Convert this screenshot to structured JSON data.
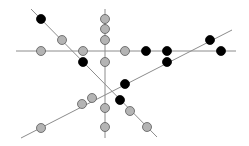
{
  "diagram": {
    "width": 249,
    "height": 146,
    "colors": {
      "background": "#ffffff",
      "line": "#8c8c8c",
      "gray_fill": "#b4b4b4",
      "gray_stroke": "#5a5a5a",
      "black_fill": "#000000"
    },
    "node_radius": 4.5,
    "lines": [
      {
        "id": "horizontal",
        "x1": 16,
        "y1": 51,
        "x2": 236,
        "y2": 51
      },
      {
        "id": "vertical",
        "x1": 105,
        "y1": 9,
        "x2": 105,
        "y2": 138
      },
      {
        "id": "descending-diagonal",
        "x1": 31,
        "y1": 9,
        "x2": 157,
        "y2": 137
      },
      {
        "id": "ascending-diagonal",
        "x1": 21,
        "y1": 138,
        "x2": 232,
        "y2": 30
      }
    ],
    "nodes": [
      {
        "x": 41,
        "y": 19,
        "color": "black"
      },
      {
        "x": 62,
        "y": 40,
        "color": "gray"
      },
      {
        "x": 41,
        "y": 51,
        "color": "gray"
      },
      {
        "x": 83,
        "y": 51,
        "color": "gray"
      },
      {
        "x": 83,
        "y": 62,
        "color": "black"
      },
      {
        "x": 105,
        "y": 19,
        "color": "gray"
      },
      {
        "x": 105,
        "y": 29,
        "color": "gray"
      },
      {
        "x": 105,
        "y": 40,
        "color": "gray"
      },
      {
        "x": 105,
        "y": 62,
        "color": "gray"
      },
      {
        "x": 125,
        "y": 51,
        "color": "gray"
      },
      {
        "x": 146,
        "y": 51,
        "color": "black"
      },
      {
        "x": 167,
        "y": 51,
        "color": "black"
      },
      {
        "x": 221,
        "y": 51,
        "color": "black"
      },
      {
        "x": 210,
        "y": 40,
        "color": "black"
      },
      {
        "x": 167,
        "y": 62,
        "color": "black"
      },
      {
        "x": 125,
        "y": 84,
        "color": "black"
      },
      {
        "x": 120,
        "y": 100,
        "color": "black"
      },
      {
        "x": 105,
        "y": 108,
        "color": "gray"
      },
      {
        "x": 105,
        "y": 127,
        "color": "gray"
      },
      {
        "x": 130,
        "y": 111,
        "color": "gray"
      },
      {
        "x": 147,
        "y": 127,
        "color": "gray"
      },
      {
        "x": 92,
        "y": 98,
        "color": "gray"
      },
      {
        "x": 82,
        "y": 104,
        "color": "gray"
      },
      {
        "x": 41,
        "y": 128,
        "color": "gray"
      }
    ]
  }
}
